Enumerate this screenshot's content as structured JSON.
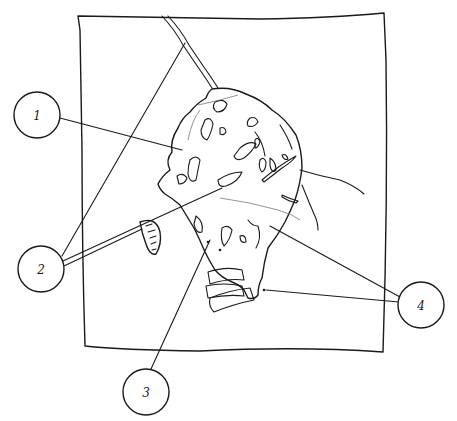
{
  "diagram": {
    "ink_color": "#1a1a1a",
    "background_color": "#ffffff",
    "callouts": [
      {
        "label": "1",
        "cx": 37,
        "cy": 115,
        "r": 23
      },
      {
        "label": "2",
        "cx": 41,
        "cy": 269,
        "r": 23
      },
      {
        "label": "3",
        "cx": 146,
        "cy": 392,
        "r": 23
      },
      {
        "label": "4",
        "cx": 421,
        "cy": 305,
        "r": 23
      }
    ]
  }
}
